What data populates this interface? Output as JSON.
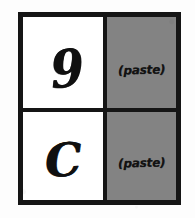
{
  "canvas": {
    "width": 195,
    "height": 218,
    "background_color": "#ffffff",
    "medium": "hand-drawn ink on paper (scanned)"
  },
  "figure": {
    "ink_color": "#151515",
    "frame": {
      "border_color": "#151515",
      "border_width_px": 5,
      "fill_color": "#ffffff"
    },
    "grid": {
      "rows": 2,
      "columns": 2,
      "divider_color": "#151515",
      "divider_width_px": 4,
      "column_fills": [
        "#ffffff",
        "#838383"
      ]
    }
  },
  "cells": [
    {
      "position": "top-left",
      "row": 1,
      "column": 1,
      "fill_color": "#ffffff",
      "content_kind": "handwritten-character",
      "text": "9"
    },
    {
      "position": "top-right",
      "row": 1,
      "column": 2,
      "fill_color": "#838383",
      "content_kind": "handwritten-annotation",
      "text": "(paste)"
    },
    {
      "position": "bottom-left",
      "row": 2,
      "column": 1,
      "fill_color": "#ffffff",
      "content_kind": "handwritten-character",
      "text": "C"
    },
    {
      "position": "bottom-right",
      "row": 2,
      "column": 2,
      "fill_color": "#838383",
      "content_kind": "handwritten-annotation",
      "text": "(paste)"
    }
  ]
}
